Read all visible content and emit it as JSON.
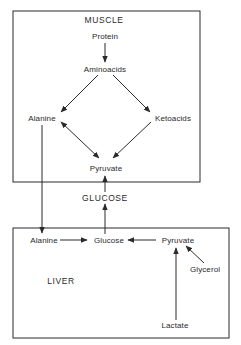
{
  "muscle": {
    "title": "MUSCLE",
    "nodes": {
      "protein": "Protein",
      "aminoacids": "Aminoacids",
      "alanine": "Alanine",
      "ketoacids": "Ketoacids",
      "pyruvate": "Pyruvate"
    }
  },
  "blood": {
    "glucose": "GLUCOSE"
  },
  "liver": {
    "title": "LIVER",
    "nodes": {
      "alanine": "Alanine",
      "glucose": "Glucose",
      "pyruvate": "Pyruvate",
      "glycerol": "Glycerol",
      "lactate": "Lactate"
    }
  },
  "colors": {
    "line": "#2a2a2a",
    "background": "#ffffff"
  }
}
